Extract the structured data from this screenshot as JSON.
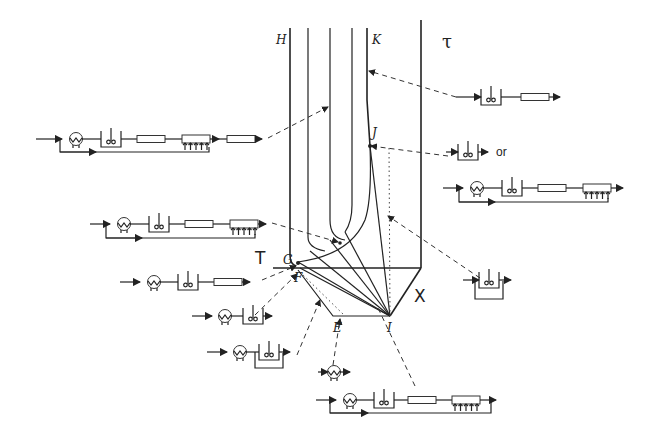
{
  "diagram": {
    "point_labels": {
      "H": "H",
      "K": "K",
      "J": "J",
      "G": "G",
      "F": "F",
      "E": "E",
      "I": "I"
    },
    "axis_labels": {
      "tau": "τ",
      "T": "T",
      "X": "X"
    },
    "or_label": "or",
    "networks": [
      {
        "id": "n1",
        "description": "CSTR + PFR",
        "points_to": "K"
      },
      {
        "id": "n2",
        "description": "Recycle heat exchanger, CSTR, PFR, PFR with side injection, PFR",
        "points_to": "H-K region"
      },
      {
        "id": "n3",
        "description": "CSTR",
        "or": true,
        "points_to": "J"
      },
      {
        "id": "n4",
        "description": "Recycle heat exchanger, CSTR, PFR, PFR with side injection",
        "points_to": "J"
      },
      {
        "id": "n5",
        "description": "Recycle heat exchanger, CSTR, PFR, PFR with side injection",
        "points_to": "G-K curve"
      },
      {
        "id": "n6",
        "description": "Heat exchanger, CSTR, PFR",
        "points_to": "G"
      },
      {
        "id": "n7",
        "description": "Heat exchanger, CSTR",
        "points_to": "F"
      },
      {
        "id": "n8",
        "description": "Heat exchanger, CSTR with bypass",
        "points_to": "F-E"
      },
      {
        "id": "n9",
        "description": "Heat exchanger",
        "points_to": "E"
      },
      {
        "id": "n10",
        "description": "CSTR with bypass",
        "points_to": "J-I"
      },
      {
        "id": "n11",
        "description": "Recycle heat exchanger, CSTR, PFR, PFR with side injection",
        "points_to": "I"
      }
    ]
  }
}
